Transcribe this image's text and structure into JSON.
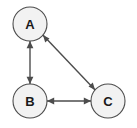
{
  "diagram": {
    "type": "directed-graph",
    "title": "",
    "background_color": "#ffffff",
    "node_fill_color": "#f2f2f2",
    "node_stroke_color": "#4d4d4d",
    "edge_color": "#4d4d4d",
    "label_color": "#1a1a1a",
    "nodes": [
      {
        "id": "A",
        "label": "A",
        "cx": 30,
        "cy": 24,
        "r": 17
      },
      {
        "id": "B",
        "label": "B",
        "cx": 30,
        "cy": 101,
        "r": 17
      },
      {
        "id": "C",
        "label": "C",
        "cx": 108,
        "cy": 101,
        "r": 17
      }
    ],
    "edges": [
      {
        "id": "A-B",
        "from": "A",
        "to": "B",
        "direction": "both",
        "style": "straight"
      },
      {
        "id": "B-C",
        "from": "B",
        "to": "C",
        "direction": "both",
        "style": "straight"
      },
      {
        "id": "A-C",
        "from": "A",
        "to": "C",
        "direction": "both",
        "style": "straight"
      }
    ]
  }
}
